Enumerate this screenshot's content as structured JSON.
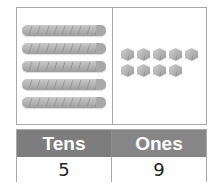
{
  "place_value_model": {
    "tens_rods": 5,
    "cubes_per_rod": 10,
    "ones_cubes": 9,
    "ones_layout": [
      5,
      4
    ]
  },
  "table": {
    "headers": [
      "Tens",
      "Ones"
    ],
    "values": [
      "5",
      "9"
    ]
  },
  "colors": {
    "header_bg": "#7d7d7d",
    "header_text": "#ffffff",
    "border": "#a9a9a9",
    "block": "#b6b6b6"
  }
}
